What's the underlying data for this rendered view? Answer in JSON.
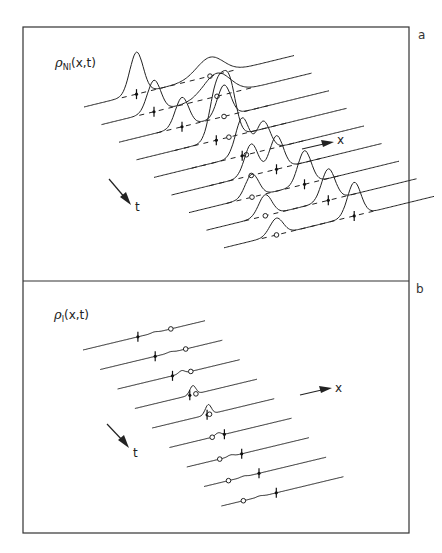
{
  "figure": {
    "panels": [
      {
        "id": "a",
        "panel_label": "a",
        "function_symbol": "ρ",
        "function_subscript": "NI",
        "function_args": "(x,t)",
        "x_axis_label": "x",
        "t_axis_label": "t",
        "description": "Non-interacting density: 9 time slices, a wavepacket splitting into two peaks"
      },
      {
        "id": "b",
        "panel_label": "b",
        "function_symbol": "ρ",
        "function_subscript": "I",
        "function_args": "(x,t)",
        "x_axis_label": "x",
        "t_axis_label": "t",
        "description": "Interacting density: 9 time slices, nearly flat traces with small bump at collision"
      }
    ]
  },
  "chart_data": [
    {
      "type": "line",
      "title": "ρ_NI(x,t)",
      "panel": "a",
      "xlabel": "x",
      "ylabel": "t",
      "num_slices": 9,
      "slices": [
        {
          "t": 0,
          "peaks": [
            {
              "pos": 0.25,
              "height": 1.0
            },
            {
              "pos": 0.6,
              "height": 0.45,
              "wide": true
            }
          ],
          "cross_marker": 0.25,
          "circle_marker": 0.6
        },
        {
          "t": 1,
          "peaks": [
            {
              "pos": 0.25,
              "height": 0.75
            },
            {
              "pos": 0.55,
              "height": 0.55,
              "wide": true
            }
          ],
          "cross_marker": 0.25,
          "circle_marker": 0.55
        },
        {
          "t": 2,
          "peaks": [
            {
              "pos": 0.3,
              "height": 0.7
            },
            {
              "pos": 0.5,
              "height": 0.75
            }
          ],
          "cross_marker": 0.3,
          "circle_marker": 0.5
        },
        {
          "t": 3,
          "peaks": [
            {
              "pos": 0.38,
              "height": 1.2
            },
            {
              "pos": 0.44,
              "height": 1.3
            }
          ],
          "cross_marker": 0.38,
          "circle_marker": 0.44
        },
        {
          "t": 4,
          "peaks": [
            {
              "pos": 0.42,
              "height": 0.9
            },
            {
              "pos": 0.52,
              "height": 0.7
            }
          ],
          "cross_marker": 0.42,
          "circle_marker": 0.44
        },
        {
          "t": 5,
          "peaks": [
            {
              "pos": 0.38,
              "height": 0.75
            },
            {
              "pos": 0.5,
              "height": 0.8
            }
          ],
          "cross_marker": 0.5,
          "circle_marker": 0.38
        },
        {
          "t": 6,
          "peaks": [
            {
              "pos": 0.3,
              "height": 0.55
            },
            {
              "pos": 0.55,
              "height": 0.8
            }
          ],
          "cross_marker": 0.55,
          "circle_marker": 0.3
        },
        {
          "t": 7,
          "peaks": [
            {
              "pos": 0.28,
              "height": 0.5
            },
            {
              "pos": 0.58,
              "height": 0.75
            }
          ],
          "cross_marker": 0.58,
          "circle_marker": 0.28
        },
        {
          "t": 8,
          "peaks": [
            {
              "pos": 0.25,
              "height": 0.4
            },
            {
              "pos": 0.62,
              "height": 0.8
            }
          ],
          "cross_marker": 0.62,
          "circle_marker": 0.25
        }
      ]
    },
    {
      "type": "line",
      "title": "ρ_I(x,t)",
      "panel": "b",
      "xlabel": "x",
      "ylabel": "t",
      "num_slices": 9,
      "slices": [
        {
          "t": 0,
          "bump": 0.05,
          "cross_marker": 0.45,
          "circle_marker": 0.72
        },
        {
          "t": 1,
          "bump": 0.05,
          "cross_marker": 0.45,
          "circle_marker": 0.7
        },
        {
          "t": 2,
          "bump": 0.15,
          "cross_marker": 0.45,
          "circle_marker": 0.6
        },
        {
          "t": 3,
          "bump": 0.45,
          "cross_marker": 0.45,
          "circle_marker": 0.5
        },
        {
          "t": 4,
          "bump": 0.5,
          "cross_marker": 0.45,
          "circle_marker": 0.47
        },
        {
          "t": 5,
          "bump": 0.15,
          "cross_marker": 0.45,
          "circle_marker": 0.35
        },
        {
          "t": 6,
          "bump": 0.08,
          "cross_marker": 0.45,
          "circle_marker": 0.27
        },
        {
          "t": 7,
          "bump": 0.05,
          "cross_marker": 0.45,
          "circle_marker": 0.2
        },
        {
          "t": 8,
          "bump": 0.05,
          "cross_marker": 0.45,
          "circle_marker": 0.18
        }
      ]
    }
  ]
}
